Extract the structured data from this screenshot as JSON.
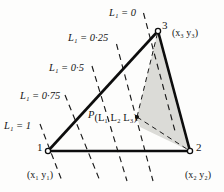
{
  "figure": {
    "type": "area-coordinate-triangle-diagram",
    "background_color": "#fdfdfc",
    "line_color": "#111111",
    "shade_color": "#d9d9d6",
    "isoline_labels": [
      {
        "id": "L1-0",
        "text_prefix": "L",
        "sub": "1",
        "eq": " = ",
        "value": "0"
      },
      {
        "id": "L1-025",
        "text_prefix": "L",
        "sub": "1",
        "eq": " = ",
        "value": "0·25"
      },
      {
        "id": "L1-05",
        "text_prefix": "L",
        "sub": "1",
        "eq": " = ",
        "value": "0·5"
      },
      {
        "id": "L1-075",
        "text_prefix": "L",
        "sub": "1",
        "eq": " = ",
        "value": "0·75"
      },
      {
        "id": "L1-1",
        "text_prefix": "L",
        "sub": "1",
        "eq": " = ",
        "value": "1"
      }
    ],
    "vertices": [
      {
        "id": "v1",
        "number": "1",
        "coord": "(x₁ y₁)"
      },
      {
        "id": "v2",
        "number": "2",
        "coord": "(x₂ y₂)"
      },
      {
        "id": "v3",
        "number": "3",
        "coord": "(x₃ y₃)"
      }
    ],
    "point_label": {
      "p": "P",
      "args": "(L₁ L₂ L₃)"
    },
    "labels": {
      "l1_0": "L₁ = 0",
      "l1_025": "L₁ = 0·25",
      "l1_05": "L₁ = 0·5",
      "l1_075": "L₁ = 0·75",
      "l1_1": "L₁ = 1",
      "v1_num": "1",
      "v2_num": "2",
      "v3_num": "3",
      "v1_coord": "(x₁ y₁)",
      "v2_coord": "(x₂ y₂)",
      "v3_coord": "(x₃ y₃)",
      "p_main": "P",
      "p_args": "(L₁ L₂ L₃)"
    }
  }
}
